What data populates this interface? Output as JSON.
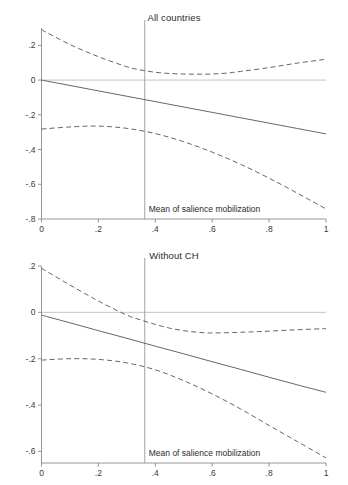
{
  "figure": {
    "background": "#ffffff",
    "line_color": "#555555",
    "axis_color": "#8a8a8a",
    "zero_line_color": "#b8b8b8",
    "caption": ""
  },
  "chart_data": [
    {
      "type": "line",
      "title": "All countries",
      "xlabel": "",
      "ylabel": "",
      "xlim": [
        0,
        1
      ],
      "ylim": [
        -0.8,
        0.3
      ],
      "grid": false,
      "legend": "none",
      "xticks": [
        "0",
        ".2",
        ".4",
        ".6",
        ".8",
        "1"
      ],
      "xtick_values": [
        0,
        0.2,
        0.4,
        0.6,
        0.8,
        1
      ],
      "yticks": [
        ".2",
        "0",
        "-.2",
        "-.4",
        "-.6",
        "-.8"
      ],
      "ytick_values": [
        0.2,
        0,
        -0.2,
        -0.4,
        -0.6,
        -0.8
      ],
      "annotations": [
        {
          "name": "mean-of-salience-mobilization",
          "text": "Mean of salience mobilization",
          "x": 0.363,
          "type": "vertical-reference-line"
        },
        {
          "name": "zero-reference-line",
          "text": "",
          "y": 0,
          "type": "horizontal-reference-line"
        }
      ],
      "series": [
        {
          "name": "Marginal effect",
          "style": "solid",
          "x": [
            0,
            0.1,
            0.2,
            0.3,
            0.4,
            0.5,
            0.6,
            0.7,
            0.8,
            0.9,
            1
          ],
          "values": [
            0.0,
            -0.031,
            -0.062,
            -0.093,
            -0.124,
            -0.155,
            -0.186,
            -0.217,
            -0.248,
            -0.279,
            -0.31
          ]
        },
        {
          "name": "Upper 95% CI",
          "style": "dashed",
          "x": [
            0,
            0.1,
            0.2,
            0.3,
            0.35,
            0.4,
            0.45,
            0.5,
            0.55,
            0.6,
            0.65,
            0.7,
            0.8,
            0.9,
            1
          ],
          "values": [
            0.29,
            0.205,
            0.135,
            0.077,
            0.058,
            0.045,
            0.038,
            0.035,
            0.034,
            0.035,
            0.04,
            0.05,
            0.072,
            0.098,
            0.12
          ]
        },
        {
          "name": "Lower 95% CI",
          "style": "dashed",
          "x": [
            0,
            0.1,
            0.2,
            0.3,
            0.4,
            0.5,
            0.6,
            0.7,
            0.8,
            0.9,
            1
          ],
          "values": [
            -0.282,
            -0.27,
            -0.265,
            -0.278,
            -0.308,
            -0.355,
            -0.415,
            -0.485,
            -0.565,
            -0.652,
            -0.742
          ]
        }
      ]
    },
    {
      "type": "line",
      "title": "Without CH",
      "xlabel": "",
      "ylabel": "",
      "xlim": [
        0,
        1
      ],
      "ylim": [
        -0.65,
        0.2
      ],
      "grid": false,
      "legend": "none",
      "xticks": [
        "0",
        ".2",
        ".4",
        ".6",
        ".8",
        "1"
      ],
      "xtick_values": [
        0,
        0.2,
        0.4,
        0.6,
        0.8,
        1
      ],
      "yticks": [
        ".2",
        "0",
        "-.2",
        "-.4",
        "-.6"
      ],
      "ytick_values": [
        0.2,
        0,
        -0.2,
        -0.4,
        -0.6
      ],
      "annotations": [
        {
          "name": "mean-of-salience-mobilization",
          "text": "Mean of salience mobilization",
          "x": 0.363,
          "type": "vertical-reference-line"
        },
        {
          "name": "zero-reference-line",
          "text": "",
          "y": 0,
          "type": "horizontal-reference-line"
        }
      ],
      "series": [
        {
          "name": "Marginal effect",
          "style": "solid",
          "x": [
            0,
            0.1,
            0.2,
            0.3,
            0.4,
            0.5,
            0.6,
            0.7,
            0.8,
            0.9,
            1
          ],
          "values": [
            -0.012,
            -0.045,
            -0.079,
            -0.112,
            -0.146,
            -0.179,
            -0.213,
            -0.246,
            -0.28,
            -0.313,
            -0.345
          ]
        },
        {
          "name": "Upper 95% CI",
          "style": "dashed",
          "x": [
            0,
            0.1,
            0.2,
            0.3,
            0.35,
            0.4,
            0.45,
            0.5,
            0.55,
            0.6,
            0.7,
            0.8,
            0.9,
            1
          ],
          "values": [
            0.19,
            0.118,
            0.049,
            -0.012,
            -0.033,
            -0.052,
            -0.068,
            -0.079,
            -0.086,
            -0.089,
            -0.086,
            -0.081,
            -0.075,
            -0.07
          ]
        },
        {
          "name": "Lower 95% CI",
          "style": "dashed",
          "x": [
            0,
            0.1,
            0.2,
            0.3,
            0.4,
            0.5,
            0.6,
            0.7,
            0.8,
            0.9,
            1
          ],
          "values": [
            -0.206,
            -0.2,
            -0.203,
            -0.218,
            -0.248,
            -0.295,
            -0.352,
            -0.417,
            -0.488,
            -0.558,
            -0.628
          ]
        }
      ]
    }
  ]
}
